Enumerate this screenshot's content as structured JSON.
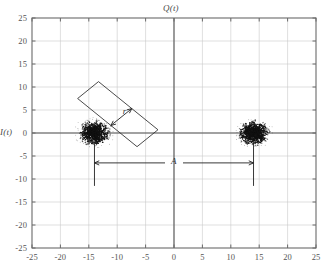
{
  "figure": {
    "kind": "constellation-scatter",
    "axis_title_top": "Q(t)",
    "axis_title_left": "I(t)",
    "annotation_r": "r",
    "annotation_A": "A"
  },
  "chart_data": {
    "type": "scatter",
    "title": "Q(t)",
    "xlabel": "",
    "ylabel": "I(t)",
    "xlim": [
      -25,
      25
    ],
    "ylim": [
      -25,
      25
    ],
    "grid": true,
    "legend": "none",
    "xticks": [
      "-25",
      "-20",
      "-15",
      "-10",
      "-5",
      "0",
      "5",
      "10",
      "15",
      "20",
      "25"
    ],
    "yticks": [
      "25",
      "20",
      "15",
      "10",
      "5",
      "0",
      "-5",
      "-10",
      "-15",
      "-20",
      "-25"
    ],
    "xtick_values": [
      -25,
      -20,
      -15,
      -10,
      -5,
      0,
      5,
      10,
      15,
      20,
      25
    ],
    "ytick_values": [
      25,
      20,
      15,
      10,
      5,
      0,
      -5,
      -10,
      -15,
      -20,
      -25
    ],
    "marker": "dot",
    "marker_color": "#111111",
    "series": [
      {
        "name": "cluster-left",
        "center": [
          -14,
          0
        ],
        "spread": 2.6,
        "n_points": 900
      },
      {
        "name": "cluster-right",
        "center": [
          14,
          0
        ],
        "spread": 2.6,
        "n_points": 900
      }
    ],
    "annotations": [
      {
        "name": "r",
        "label": "r",
        "kind": "double-arrow-diagonal",
        "meaning": "cluster radius",
        "from": [
          -12.0,
          7.0
        ],
        "to": [
          -8.0,
          3.0
        ],
        "label_pos": [
          -9.8,
          5.4
        ]
      },
      {
        "name": "A",
        "label": "A",
        "kind": "dimension-double-arrow-horizontal",
        "meaning": "separation between constellation points",
        "from": [
          -14,
          -6.5
        ],
        "to": [
          14,
          -6.5
        ],
        "label_pos": [
          0,
          -6.5
        ]
      }
    ]
  }
}
